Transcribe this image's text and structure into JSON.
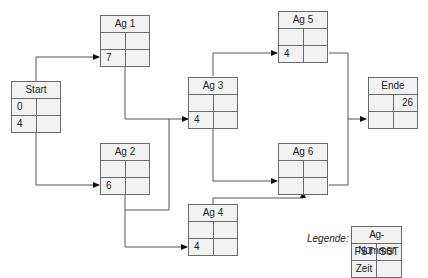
{
  "diagram": {
    "type": "network-plan",
    "nodes": {
      "start": {
        "title": "Start",
        "fst": "0",
        "sst": "",
        "zeit": "4",
        "extra": ""
      },
      "ag1": {
        "title": "Ag 1",
        "fst": "",
        "sst": "",
        "zeit": "7",
        "extra": ""
      },
      "ag2": {
        "title": "Ag 2",
        "fst": "",
        "sst": "",
        "zeit": "6",
        "extra": ""
      },
      "ag3": {
        "title": "Ag 3",
        "fst": "",
        "sst": "",
        "zeit": "4",
        "extra": ""
      },
      "ag4": {
        "title": "Ag 4",
        "fst": "",
        "sst": "",
        "zeit": "4",
        "extra": ""
      },
      "ag5": {
        "title": "Ag 5",
        "fst": "",
        "sst": "",
        "zeit": "4",
        "extra": ""
      },
      "ag6": {
        "title": "Ag 6",
        "fst": "",
        "sst": "",
        "zeit": "",
        "extra": ""
      },
      "ende": {
        "title": "Ende",
        "fst": "",
        "sst": "26",
        "zeit": "",
        "extra": ""
      }
    },
    "edges": [
      {
        "from": "Start",
        "to": "Ag 1"
      },
      {
        "from": "Start",
        "to": "Ag 2"
      },
      {
        "from": "Ag 1",
        "to": "Ag 3"
      },
      {
        "from": "Ag 2",
        "to": "Ag 3"
      },
      {
        "from": "Ag 2",
        "to": "Ag 4"
      },
      {
        "from": "Ag 3",
        "to": "Ag 5"
      },
      {
        "from": "Ag 3",
        "to": "Ag 6"
      },
      {
        "from": "Ag 4",
        "to": "Ag 6"
      },
      {
        "from": "Ag 5",
        "to": "Ende"
      },
      {
        "from": "Ag 6",
        "to": "Ende"
      }
    ],
    "legend": {
      "label": "Legende:",
      "header": "Ag-Nummer",
      "fst": "FST",
      "sst": "SST",
      "zeit": "Zeit",
      "empty": ""
    }
  }
}
